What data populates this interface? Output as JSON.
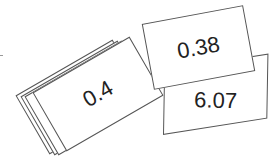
{
  "cards": [
    {
      "id": "stack-back-3",
      "label": ""
    },
    {
      "id": "stack-back-2",
      "label": ""
    },
    {
      "id": "stack-back-1",
      "label": ""
    },
    {
      "id": "stack-front",
      "label": "0.4"
    },
    {
      "id": "card-a",
      "label": "6.07"
    },
    {
      "id": "card-b",
      "label": "0.38"
    }
  ],
  "colors": {
    "border": "#555555",
    "text": "#222222",
    "background": "#ffffff"
  }
}
